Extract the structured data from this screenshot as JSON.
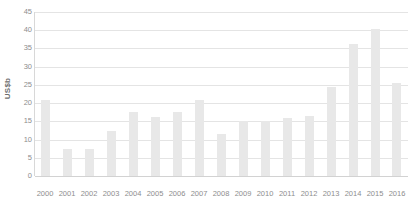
{
  "chart_data": {
    "type": "bar",
    "title": "",
    "xlabel": "",
    "ylabel": "US$b",
    "ylim": [
      0,
      45
    ],
    "ytick_step": 5,
    "yticks": [
      45,
      40,
      35,
      30,
      25,
      20,
      15,
      10,
      5,
      0
    ],
    "ytick_labels": [
      "45",
      "40",
      "35",
      "30",
      "25",
      "20",
      "15",
      "10",
      "5",
      "0"
    ],
    "grid": true,
    "legend": "none",
    "bar_color": "#e8e8e8",
    "gridline_color": "#e4e4e4",
    "axis_color": "#d8d8d8",
    "text_color": "#8d8d8d",
    "categories": [
      "2000",
      "2001",
      "2002",
      "2003",
      "2004",
      "2005",
      "2006",
      "2007",
      "2008",
      "2009",
      "2010",
      "2011",
      "2012",
      "2013",
      "2014",
      "2015",
      "2016"
    ],
    "values": [
      20.8,
      7.4,
      7.5,
      12.3,
      17.5,
      16.2,
      17.5,
      20.9,
      11.5,
      15.2,
      15.2,
      15.8,
      16.5,
      24.4,
      36.2,
      40.4,
      25.4
    ]
  }
}
